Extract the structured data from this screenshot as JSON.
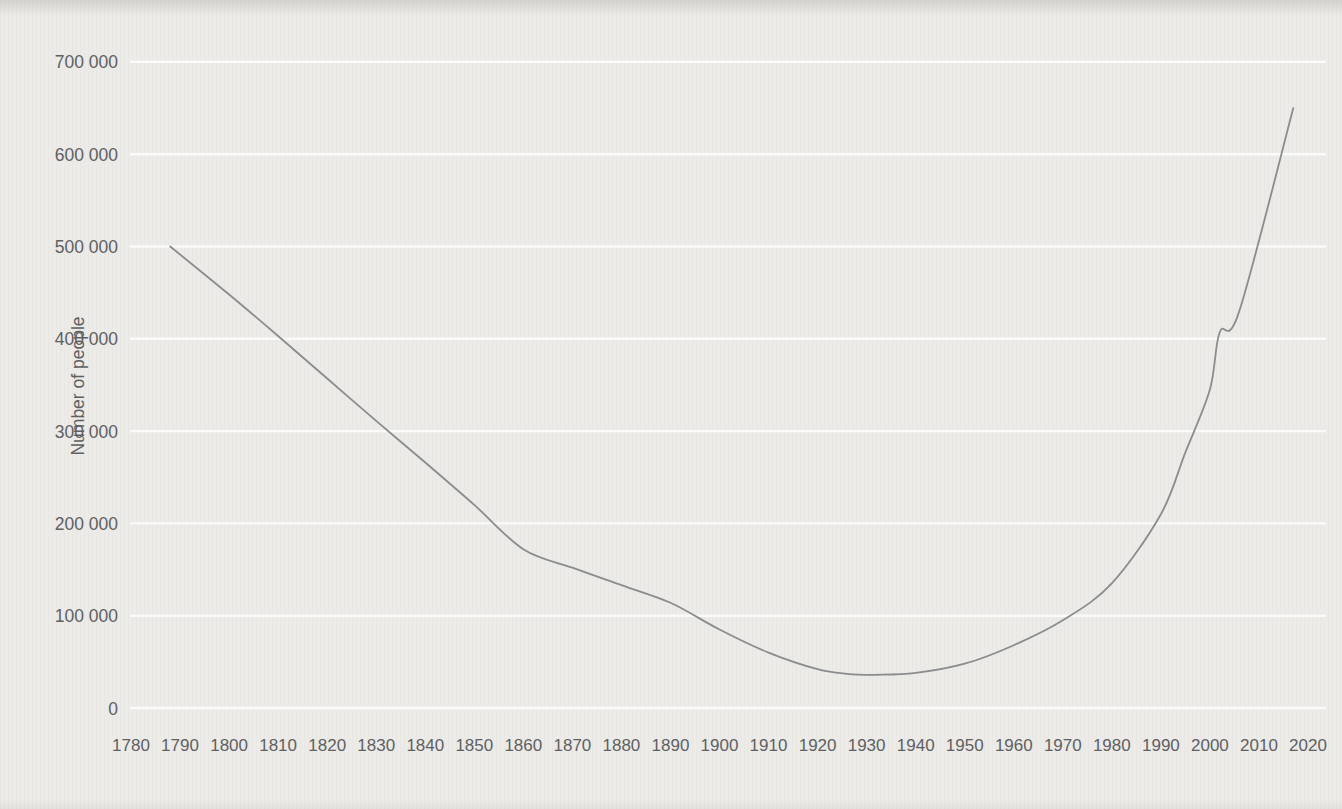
{
  "page": {
    "background_color": "#ecebe8",
    "scan_edge_color": "#dededa"
  },
  "chart_data": {
    "type": "line",
    "title": "",
    "xlabel": "",
    "ylabel": "Number of people",
    "xlim": [
      1780,
      2020
    ],
    "ylim": [
      0,
      700000
    ],
    "grid": "horizontal",
    "legend": "none",
    "x_ticks": [
      1780,
      1790,
      1800,
      1810,
      1820,
      1830,
      1840,
      1850,
      1860,
      1870,
      1880,
      1890,
      1900,
      1910,
      1920,
      1930,
      1940,
      1950,
      1960,
      1970,
      1980,
      1990,
      2000,
      2010,
      2020
    ],
    "y_ticks": [
      {
        "value": 0,
        "label": "0"
      },
      {
        "value": 100000,
        "label": "100 000"
      },
      {
        "value": 200000,
        "label": "200 000"
      },
      {
        "value": 300000,
        "label": "300 000"
      },
      {
        "value": 400000,
        "label": "400 000"
      },
      {
        "value": 500000,
        "label": "500 000"
      },
      {
        "value": 600000,
        "label": "600 000"
      },
      {
        "value": 700000,
        "label": "700 000"
      }
    ],
    "series": [
      {
        "name": "Number of people",
        "color": "#8a8c8e",
        "points": [
          [
            1788,
            500000
          ],
          [
            1800,
            448000
          ],
          [
            1810,
            403000
          ],
          [
            1820,
            357000
          ],
          [
            1830,
            311000
          ],
          [
            1840,
            266000
          ],
          [
            1850,
            220000
          ],
          [
            1860,
            172000
          ],
          [
            1870,
            152000
          ],
          [
            1880,
            133000
          ],
          [
            1890,
            114000
          ],
          [
            1900,
            85000
          ],
          [
            1910,
            60000
          ],
          [
            1920,
            42000
          ],
          [
            1926,
            37000
          ],
          [
            1932,
            36000
          ],
          [
            1940,
            38000
          ],
          [
            1950,
            48000
          ],
          [
            1960,
            68000
          ],
          [
            1970,
            95000
          ],
          [
            1980,
            135000
          ],
          [
            1990,
            210000
          ],
          [
            1995,
            277000
          ],
          [
            2000,
            345000
          ],
          [
            2002,
            407000
          ],
          [
            2006,
            430000
          ],
          [
            2017,
            650000
          ]
        ]
      }
    ],
    "colors": {
      "gridline": "#fafaf8",
      "tick_text": "#5e6062",
      "axis_title_text": "#5e6062",
      "line": "#8a8c8e"
    }
  }
}
